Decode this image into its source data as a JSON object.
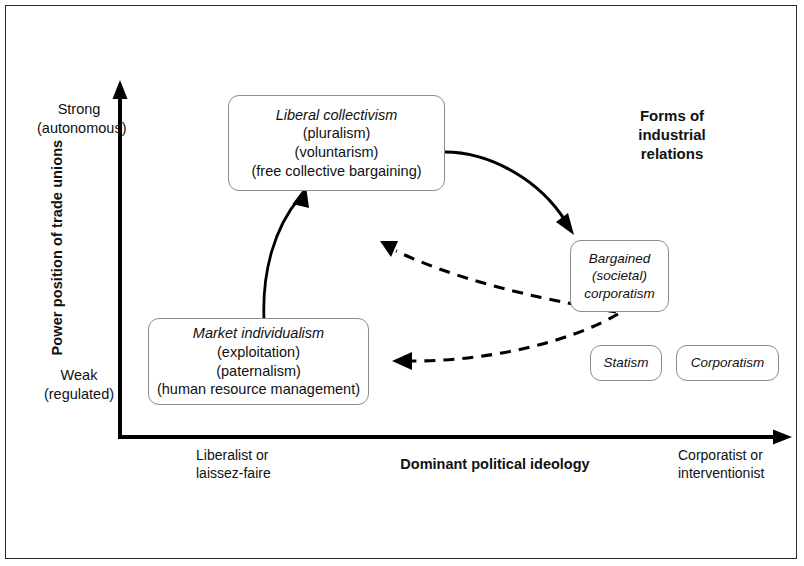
{
  "figure": {
    "title_block": {
      "lines": [
        "Forms of",
        "industrial",
        "relations"
      ]
    },
    "axes": {
      "y": {
        "label": "Power position of trade unions",
        "high": {
          "line1": "Strong",
          "line2": "(autonomous)"
        },
        "low": {
          "line1": "Weak",
          "line2": "(regulated)"
        }
      },
      "x": {
        "label": "Dominant political ideology",
        "left": {
          "line1": "Liberalist or",
          "line2": "laissez-faire"
        },
        "right": {
          "line1": "Corporatist or",
          "line2": "interventionist"
        }
      }
    },
    "nodes": {
      "liberal_collectivism": {
        "title": "Liberal collectivism",
        "sub1": "(pluralism)",
        "sub2": "(voluntarism)",
        "sub3": "(free collective bargaining)"
      },
      "market_individualism": {
        "title": "Market individualism",
        "sub1": "(exploitation)",
        "sub2": "(paternalism)",
        "sub3": "(human resource management)"
      },
      "bargained_corporatism": {
        "line1": "Bargained",
        "line2": "(societal)",
        "line3": "corporatism"
      },
      "statism": {
        "label": "Statism"
      },
      "corporatism": {
        "label": "Corporatism"
      }
    },
    "colors": {
      "ink": "#111111",
      "box_border": "#8c8c8c",
      "axis": "#000000",
      "frame": "#2b2b2b",
      "background": "#ffffff"
    }
  }
}
